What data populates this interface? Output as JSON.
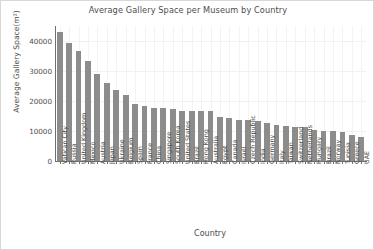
{
  "chart_data": {
    "type": "bar",
    "title": "Average Gallery Space per Museum by Country",
    "xlabel": "Country",
    "ylabel": "Average Gallery Space(m²)",
    "ylim": [
      0,
      45000
    ],
    "yticks": [
      0,
      10000,
      20000,
      30000,
      40000
    ],
    "ytick_labels": [
      "0",
      "10000",
      "20000",
      "30000",
      "40000"
    ],
    "grid": true,
    "legend": null,
    "bar_color": "#8c8c8c",
    "categories": [
      "Vatican City",
      "Russia",
      "United Kingdom",
      "Mexico",
      "Austria",
      "Japan",
      "Ukraine",
      "Belgium",
      "Spain",
      "France",
      "China",
      "Singapore",
      "South Korea",
      "United States",
      "Brazil",
      "Hong Kong",
      "Australia",
      "Egypt",
      "Canada",
      "Israel",
      "Czech Republic",
      "India",
      "Germany",
      "Italy",
      "Taiwan",
      "Switzerland",
      "Netherlands",
      "Hungary",
      "Brazil",
      "Norway",
      "Tunisia",
      "Greece",
      "UAE"
    ],
    "values": [
      43000,
      39500,
      36800,
      33200,
      29000,
      26000,
      23800,
      22100,
      19000,
      18500,
      17800,
      17600,
      17400,
      16700,
      16600,
      16600,
      16700,
      14700,
      14300,
      13700,
      13600,
      13500,
      12600,
      11900,
      11700,
      11500,
      11200,
      10400,
      10000,
      9900,
      9800,
      8600,
      7900
    ]
  }
}
